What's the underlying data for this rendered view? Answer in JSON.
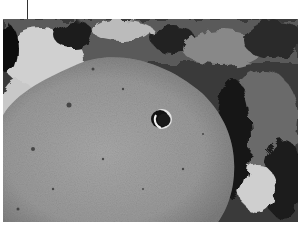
{
  "image": {
    "subject": "lunar crater",
    "description": "Grayscale photograph of a large flat-floored crater on the Moon with a small bowl-shaped crater on its floor",
    "colors": {
      "floor": "#9a9a9a",
      "shadow": "#1a1a1a",
      "highlight": "#d8d8d8",
      "background": "#ffffff"
    }
  }
}
